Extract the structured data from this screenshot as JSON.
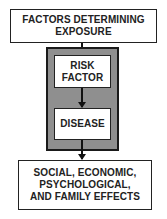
{
  "diagram": {
    "nodes": {
      "exposure": {
        "line1": "FACTORS DETERMINING",
        "line2": "EXPOSURE"
      },
      "risk_factor": {
        "line1": "RISK",
        "line2": "FACTOR"
      },
      "disease": {
        "line1": "DISEASE"
      },
      "effects": {
        "line1": "SOCIAL, ECONOMIC,",
        "line2": "PSYCHOLOGICAL,",
        "line3": "AND FAMILY EFFECTS"
      }
    },
    "edges": [
      {
        "from": "exposure",
        "to": "risk_factor"
      },
      {
        "from": "risk_factor",
        "to": "disease"
      },
      {
        "from": "disease",
        "to": "effects"
      }
    ],
    "colors": {
      "frame_fill": "#8f8f8f",
      "border": "#222222",
      "box_fill": "#ffffff"
    }
  }
}
